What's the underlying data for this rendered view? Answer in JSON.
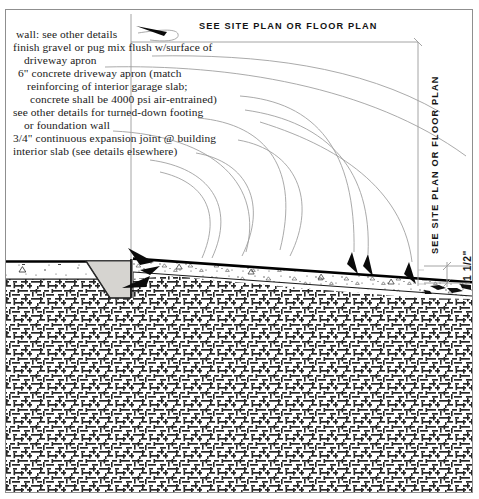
{
  "drawing": {
    "title_header_top": "SEE SITE PLAN OR FLOOR PLAN",
    "title_header_right": "SEE SITE PLAN OR FLOOR PLAN",
    "dimension_right": "1 1/2\"",
    "notes": [
      "wall: see other details",
      "finish gravel or pug mix flush w/surface of",
      "   driveway apron",
      "6\" concrete driveway apron (match",
      "   reinforcing of interior garage slab;",
      "   concrete shall be 4000 psi air-entrained)",
      "see other details for turned-down footing",
      "   or foundation wall",
      "3/4\" continuous expansion joint @ building",
      "interior slab (see details elsewhere)"
    ],
    "note_lines": {
      "l1": "wall: see other details",
      "l2": "finish gravel or pug mix flush w/surface of",
      "l3": "driveway apron",
      "l4": "6\" concrete driveway apron (match",
      "l5": "reinforcing of interior garage slab;",
      "l6": "concrete shall be 4000 psi air-entrained)",
      "l7": "see other details for turned-down footing",
      "l8": "or foundation wall",
      "l9": "3/4\" continuous expansion joint @ building",
      "l10": "interior slab (see details elsewhere)"
    },
    "colors": {
      "ink": "#141414",
      "leader": "#8d8d8d",
      "border": "#8f8f8f",
      "footing_fill": "#d6d4d0",
      "earth_hatch": "#2b2b2b",
      "slab_line": "#000000"
    },
    "elements": {
      "interior_slab": "interior garage slab",
      "turned_down_footing": "turned-down footing",
      "driveway_apron": "6\" concrete driveway apron",
      "expansion_joint": "3/4\" continuous expansion joint",
      "earth_fill": "compacted earth fill",
      "wall_line": "wall reference line"
    }
  }
}
